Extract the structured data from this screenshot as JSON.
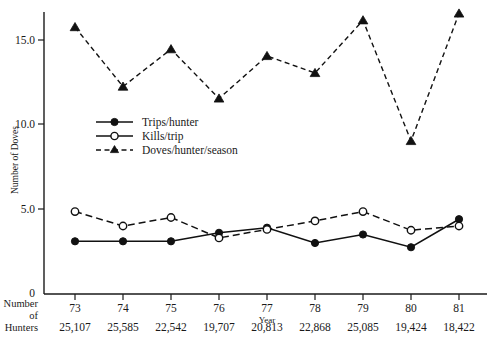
{
  "chart_data": {
    "type": "line",
    "title": "",
    "xlabel": "Year",
    "ylabel": "Number of Doves",
    "categories": [
      "73",
      "74",
      "75",
      "76",
      "77",
      "78",
      "79",
      "80",
      "81"
    ],
    "ylim": [
      0,
      17.5
    ],
    "yticks": [
      "5.0",
      "10.0",
      "15.0"
    ],
    "ytick_values": [
      5.0,
      10.0,
      15.0
    ],
    "zero_tick": "0",
    "grid": false,
    "legend_position": "upper-left-inside",
    "series": [
      {
        "name": "Trips/hunter",
        "marker": "filled-circle",
        "line": "solid",
        "values": [
          3.1,
          3.1,
          3.1,
          3.6,
          3.9,
          3.0,
          3.5,
          2.75,
          4.4
        ]
      },
      {
        "name": "Kills/trip",
        "marker": "open-circle",
        "line": "dash-dot",
        "values": [
          4.85,
          4.0,
          4.5,
          3.3,
          3.8,
          4.3,
          4.85,
          3.75,
          4.0
        ]
      },
      {
        "name": "Doves/hunter/season",
        "marker": "filled-triangle",
        "line": "dashed",
        "values": [
          15.7,
          12.2,
          14.4,
          11.5,
          14.0,
          13.0,
          16.1,
          9.0,
          16.5
        ]
      }
    ],
    "secondary_axis": {
      "label_lines": [
        "Number",
        "of",
        "Hunters"
      ],
      "values": [
        "25,107",
        "25,585",
        "22,542",
        "19,707",
        "20,813",
        "22,868",
        "25,085",
        "19,424",
        "18,422"
      ]
    },
    "colors": {
      "ink": "#111111",
      "background": "#ffffff"
    }
  },
  "legend": {
    "items": [
      {
        "label": "Trips/hunter"
      },
      {
        "label": "Kills/trip"
      },
      {
        "label": "Doves/hunter/season"
      }
    ]
  }
}
